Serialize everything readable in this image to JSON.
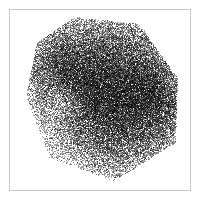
{
  "figure": {
    "width": 200,
    "height": 200,
    "background_color": "#ffffff",
    "frame": {
      "x": 9,
      "y": 9,
      "width": 182,
      "height": 182,
      "border_color": "#c9c9c9",
      "border_width": 1,
      "fill_color": "#ffffff"
    },
    "title": "",
    "xlabel": "",
    "ylabel": "",
    "tick_labels_visible": false,
    "legend_visible": false,
    "grid_visible": false
  },
  "chart_data": {
    "type": "scatter",
    "title": "",
    "xlabel": "",
    "ylabel": "",
    "xlim": [
      0,
      1
    ],
    "ylim": [
      0,
      1
    ],
    "grid": false,
    "legend": null,
    "marker": {
      "color": "#000000",
      "size_px": 1,
      "shape": "point",
      "alpha": 0.38
    },
    "point_count": 42000,
    "distribution": "dense-polygonal-cloud",
    "cloud_polygon": [
      [
        0.36,
        0.96
      ],
      [
        0.72,
        0.92
      ],
      [
        0.93,
        0.62
      ],
      [
        0.92,
        0.26
      ],
      [
        0.58,
        0.05
      ],
      [
        0.22,
        0.18
      ],
      [
        0.09,
        0.52
      ],
      [
        0.15,
        0.82
      ]
    ],
    "density_centers": [
      {
        "x": 0.62,
        "y": 0.72,
        "weight": 1.0,
        "radius": 0.3
      },
      {
        "x": 0.6,
        "y": 0.34,
        "weight": 0.95,
        "radius": 0.3
      },
      {
        "x": 0.42,
        "y": 0.52,
        "weight": 0.7,
        "radius": 0.26
      },
      {
        "x": 0.8,
        "y": 0.5,
        "weight": 0.75,
        "radius": 0.24
      },
      {
        "x": 0.28,
        "y": 0.7,
        "weight": 0.55,
        "radius": 0.22
      }
    ],
    "void_regions": [
      {
        "x": 0.3,
        "y": 0.48,
        "radius": 0.14,
        "strength": 0.55
      }
    ],
    "series": [
      {
        "name": "points",
        "color": "#000000",
        "n": 42000
      }
    ]
  }
}
